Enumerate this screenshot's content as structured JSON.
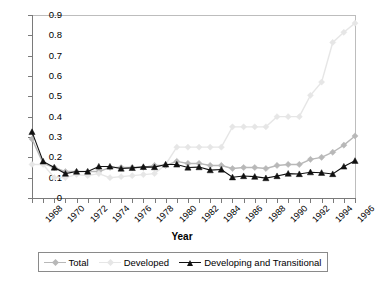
{
  "chart_data": {
    "type": "line",
    "title": "",
    "xlabel": "Year",
    "ylabel": "",
    "xlim": [
      1968,
      1997
    ],
    "ylim": [
      0,
      0.9
    ],
    "grid": false,
    "legend_position": "bottom",
    "x": [
      1968,
      1969,
      1970,
      1971,
      1972,
      1973,
      1974,
      1975,
      1976,
      1977,
      1978,
      1979,
      1980,
      1981,
      1982,
      1983,
      1984,
      1985,
      1986,
      1987,
      1988,
      1989,
      1990,
      1991,
      1992,
      1993,
      1994,
      1995,
      1996,
      1997
    ],
    "y_ticks": [
      "0",
      "0.1",
      "0.2",
      "0.3",
      "0.4",
      "0.5",
      "0.6",
      "0.7",
      "0.8",
      "0.9"
    ],
    "y_tick_values": [
      0,
      0.1,
      0.2,
      0.3,
      0.4,
      0.5,
      0.6,
      0.7,
      0.8,
      0.9
    ],
    "x_tick_labels": [
      "1968",
      "1970",
      "1972",
      "1974",
      "1976",
      "1978",
      "1980",
      "1982",
      "1984",
      "1986",
      "1988",
      "1990",
      "1992",
      "1994",
      "1996"
    ],
    "x_tick_label_values": [
      1968,
      1970,
      1972,
      1974,
      1976,
      1978,
      1980,
      1982,
      1984,
      1986,
      1988,
      1990,
      1992,
      1994,
      1996
    ],
    "series": [
      {
        "name": "Total",
        "color": "#b8b8b8",
        "marker": "diamond",
        "values": [
          0.29,
          0.17,
          0.15,
          0.13,
          0.13,
          0.13,
          0.13,
          0.15,
          0.15,
          0.15,
          0.15,
          0.16,
          0.16,
          0.18,
          0.17,
          0.17,
          0.16,
          0.16,
          0.145,
          0.15,
          0.15,
          0.145,
          0.16,
          0.165,
          0.165,
          0.19,
          0.2,
          0.225,
          0.26,
          0.305
        ]
      },
      {
        "name": "Developed",
        "color": "#e6e6e6",
        "marker": "diamond",
        "values": [
          0.165,
          0.165,
          0.1,
          0.1,
          0.115,
          0.11,
          0.12,
          0.1,
          0.105,
          0.11,
          0.115,
          0.12,
          0.165,
          0.25,
          0.25,
          0.25,
          0.25,
          0.25,
          0.35,
          0.35,
          0.35,
          0.35,
          0.4,
          0.4,
          0.4,
          0.505,
          0.57,
          0.765,
          0.815,
          0.86
        ]
      },
      {
        "name": "Developing and Transitional",
        "color": "#111111",
        "marker": "triangle",
        "values": [
          0.325,
          0.18,
          0.15,
          0.12,
          0.13,
          0.13,
          0.155,
          0.155,
          0.145,
          0.148,
          0.153,
          0.152,
          0.165,
          0.165,
          0.15,
          0.152,
          0.137,
          0.14,
          0.102,
          0.108,
          0.105,
          0.098,
          0.108,
          0.12,
          0.118,
          0.127,
          0.124,
          0.118,
          0.155,
          0.183
        ]
      }
    ]
  },
  "legend": {
    "items": [
      {
        "label": "Total"
      },
      {
        "label": "Developed"
      },
      {
        "label": "Developing and Transitional"
      }
    ]
  },
  "axis": {
    "x_title": "Year"
  }
}
